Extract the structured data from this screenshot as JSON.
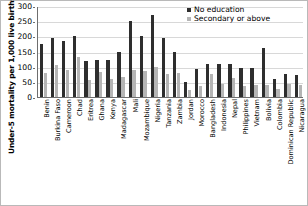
{
  "chart_data": {
    "type": "bar",
    "title": "",
    "xlabel": "",
    "ylabel": "Under-5 mortality per 1,000 live births",
    "ylim": [
      0,
      300
    ],
    "yticks": [
      0,
      50,
      100,
      150,
      200,
      250,
      300
    ],
    "grid": true,
    "legend_position": "top-right",
    "categories": [
      "Benin",
      "Burkina Faso",
      "Cameroon",
      "Chad",
      "Eritrea",
      "Ghana",
      "Kenya",
      "Madagascar",
      "Mali",
      "Mozambique",
      "Nigeria",
      "Tanzania",
      "Zambia",
      "Jordan",
      "Morocco",
      "Bangladesh",
      "Indonesia",
      "Nepal",
      "Philippines",
      "Vietnam",
      "Bolivia",
      "Colombia",
      "Dominican Republic",
      "Nicaragua"
    ],
    "series": [
      {
        "name": "No education",
        "color": "#2e2e2e",
        "values": [
          175,
          195,
          185,
          200,
          120,
          121,
          123,
          150,
          250,
          200,
          270,
          193,
          150,
          48,
          93,
          110,
          108,
          110,
          95,
          95,
          160,
          60,
          75,
          72
        ]
      },
      {
        "name": "Secondary or above",
        "color": "#b5b5b5",
        "values": [
          80,
          105,
          88,
          133,
          57,
          84,
          60,
          65,
          90,
          85,
          100,
          77,
          80,
          22,
          37,
          75,
          42,
          62,
          35,
          38,
          40,
          25,
          44,
          40
        ]
      }
    ]
  },
  "legend": {
    "items": [
      {
        "label": "No education"
      },
      {
        "label": "Secondary or above"
      }
    ]
  }
}
